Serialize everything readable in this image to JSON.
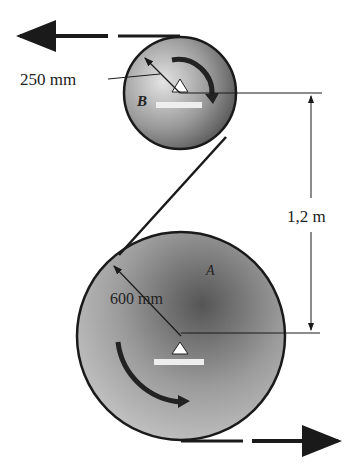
{
  "diagram": {
    "pulley_b": {
      "label": "B",
      "radius_label": "250 mm"
    },
    "pulley_a": {
      "label": "A",
      "radius_label": "600 mm"
    },
    "center_distance_label": "1,2 m",
    "colors": {
      "line": "#1a1a1a",
      "pulley_light": "#d8d8d8",
      "pulley_dark": "#555555",
      "base": "#e8e8e8"
    }
  }
}
